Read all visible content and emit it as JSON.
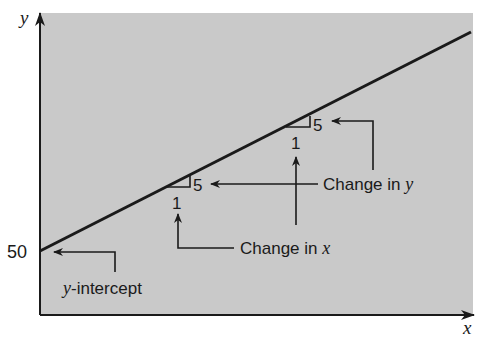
{
  "figure": {
    "background_color": "#ffffff",
    "plot_fill_color": "#c9c9c9",
    "line_color": "#1a1a1a"
  },
  "axes": {
    "x_label": "x",
    "y_label": "y",
    "y_tick_label": "50"
  },
  "line": {
    "intercept": 50,
    "slope": 5
  },
  "slope_triangles": [
    {
      "rise_label": "5",
      "run_label": "1"
    },
    {
      "rise_label": "5",
      "run_label": "1"
    }
  ],
  "annotations": {
    "change_in_y": {
      "prefix": "Change in ",
      "variable": "y"
    },
    "change_in_x": {
      "prefix": "Change in ",
      "variable": "x"
    },
    "y_intercept": {
      "variable": "y",
      "suffix": "-intercept"
    }
  }
}
